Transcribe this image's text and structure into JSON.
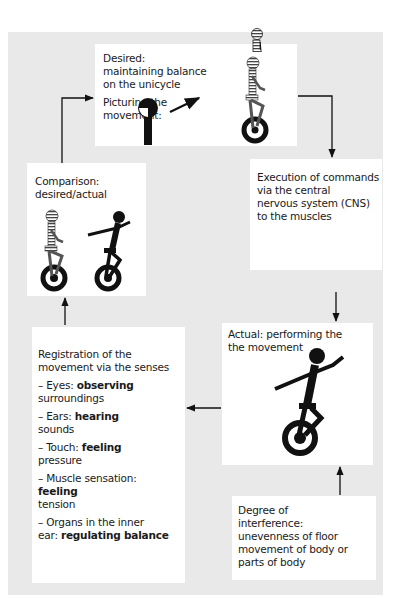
{
  "diagram": {
    "type": "feedback-loop",
    "background_color": "#e9e9e9",
    "box_color": "#ffffff",
    "nodes": {
      "desired": {
        "title": "Desired:",
        "lines": [
          "maintaining balance",
          "on the unicycle"
        ],
        "sub_label_1": "Picturing the",
        "sub_label_2": "movement:",
        "figure": "striped-unicyclist (ideal)"
      },
      "execution": {
        "lines": [
          "Execution of commands",
          "via the central",
          "nervous system (CNS)",
          "to the muscles"
        ]
      },
      "comparison": {
        "title": "Comparison:",
        "subtitle": "desired/actual",
        "figures": [
          "striped-unicyclist (desired)",
          "black-unicyclist (actual)"
        ]
      },
      "actual": {
        "line1": "Actual: performing the",
        "line2": "the movement",
        "figure": "black-unicyclist (actual)"
      },
      "registration": {
        "intro1": "Registration of the",
        "intro2": "movement via the senses",
        "senses": [
          {
            "prefix": "– Eyes: ",
            "bold": "observing",
            "rest": "surroundings"
          },
          {
            "prefix": "– Ears: ",
            "bold": "hearing",
            "rest": "sounds"
          },
          {
            "prefix": "– Touch: ",
            "bold": "feeling",
            "rest": "pressure"
          },
          {
            "prefix": "– Muscle sensation:",
            "bold": "feeling",
            "rest": "tension"
          },
          {
            "prefix": "– Organs in the inner",
            "prefix2": "ear: ",
            "bold": "regulating balance"
          }
        ]
      },
      "interference": {
        "lines": [
          "Degree of",
          "interference:",
          "unevenness of floor",
          "movement of body or",
          "parts of body"
        ]
      }
    },
    "edges": [
      {
        "from": "desired",
        "to": "execution"
      },
      {
        "from": "execution",
        "to": "actual"
      },
      {
        "from": "interference",
        "to": "actual"
      },
      {
        "from": "actual",
        "to": "registration"
      },
      {
        "from": "registration",
        "to": "comparison"
      },
      {
        "from": "comparison",
        "to": "desired"
      }
    ]
  }
}
